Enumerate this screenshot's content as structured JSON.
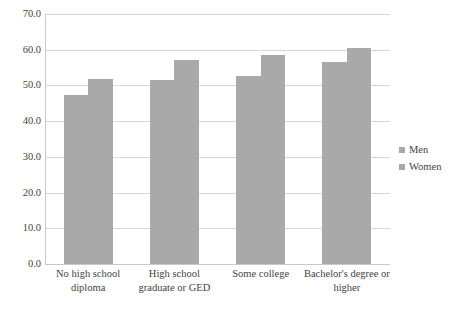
{
  "chart_data": {
    "type": "bar",
    "title": "",
    "subtitle": "",
    "xlabel": "",
    "ylabel": "",
    "categories": [
      "No high school diploma",
      "High school graduate or GED",
      "Some college",
      "Bachelor's degree or higher"
    ],
    "category_lines": [
      [
        "No high school",
        "diploma"
      ],
      [
        "High school",
        "graduate or GED"
      ],
      [
        "Some college",
        ""
      ],
      [
        "Bachelor's degree or",
        "higher"
      ]
    ],
    "series": [
      {
        "name": "Men",
        "values": [
          47.2,
          51.5,
          52.6,
          56.7
        ],
        "color": "#a9a9a9"
      },
      {
        "name": "Women",
        "values": [
          51.8,
          57.2,
          58.4,
          60.4
        ],
        "color": "#a9a9a9"
      }
    ],
    "ylim": [
      0,
      70
    ],
    "ytick_values": [
      0,
      10,
      20,
      30,
      40,
      50,
      60,
      70
    ],
    "ytick_labels": [
      "0.0",
      "10.0",
      "20.0",
      "30.0",
      "40.0",
      "50.0",
      "60.0",
      "70.0"
    ],
    "grid": true,
    "grid_axis": "y",
    "legend_position": "right",
    "legend_entries": [
      "Men",
      "Women"
    ],
    "bar_color": "#a9a9a9",
    "grid_color": "#d6d6d6",
    "axis_color": "#c9c9c9",
    "text_color": "#3f3f3f",
    "background": "#ffffff"
  }
}
